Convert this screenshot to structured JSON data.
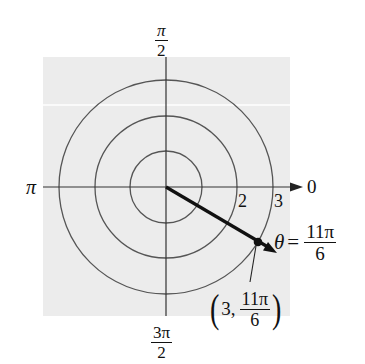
{
  "diagram": {
    "type": "polar-coordinate-plot",
    "colors": {
      "background": "#ffffff",
      "plot_area": "#ececec",
      "plot_stripe": "#fafafa",
      "grid": "#555555",
      "axis": "#333333",
      "vector": "#111111"
    },
    "center": {
      "x": 166,
      "y": 187
    },
    "rings": [
      {
        "r": 1,
        "radius_px": 36
      },
      {
        "r": 2,
        "radius_px": 71
      },
      {
        "r": 3,
        "radius_px": 107
      }
    ],
    "axis_labels": {
      "top": {
        "num": "π",
        "den": "2"
      },
      "left": "π",
      "right": "0",
      "bottom": {
        "num": "3π",
        "den": "2"
      }
    },
    "ring_labels": [
      "2",
      "3"
    ],
    "point": {
      "r": 3,
      "theta": "11π/6",
      "x_px": 258,
      "y_px": 242,
      "coordinate_label": {
        "open": "(",
        "r": "3,",
        "num": "11π",
        "den": "6",
        "close": ")"
      }
    },
    "angle_label": {
      "symbol": "θ",
      "equals": "=",
      "num": "11π",
      "den": "6"
    }
  }
}
